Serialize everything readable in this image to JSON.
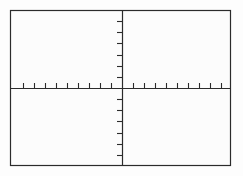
{
  "figure": {
    "title": "",
    "background_color": "#fdfdfd",
    "plot_background_color": "#fcfcfc",
    "line_color": "#2b2b2b",
    "frame": {
      "x": 10,
      "y": 10,
      "width": 221,
      "height": 156,
      "border_width": 1.2
    }
  },
  "chart_data": {
    "type": "line",
    "title": "",
    "subtitle": "",
    "xlabel": "",
    "ylabel": "",
    "series": [],
    "x": [],
    "values": [],
    "grid": false,
    "legend": null,
    "xlim": [
      -10,
      10
    ],
    "ylim": [
      -7,
      7
    ],
    "axes": {
      "x_axis": {
        "name": "x-axis",
        "position_px": 88,
        "from_px": 10,
        "to_px": 231,
        "tick_spacing_px": 11.05,
        "tick_length_px": 5,
        "tick_direction": "up",
        "tick_count": 20,
        "tick_labels": []
      },
      "y_axis": {
        "name": "y-axis",
        "position_px": 122,
        "from_px": 10,
        "to_px": 166,
        "tick_spacing_px": 11.14,
        "tick_length_px": 5,
        "tick_direction": "left",
        "tick_count": 14,
        "tick_labels": []
      }
    },
    "annotations": [],
    "data_points": []
  }
}
